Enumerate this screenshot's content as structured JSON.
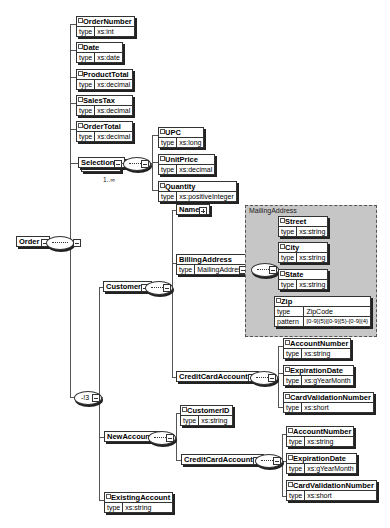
{
  "root": {
    "name": "Order"
  },
  "order_children": [
    {
      "name": "OrderNumber",
      "type_label": "type",
      "type": "xs:int"
    },
    {
      "name": "Date",
      "type_label": "type",
      "type": "xs:date"
    },
    {
      "name": "ProductTotal",
      "type_label": "type",
      "type": "xs:decimal"
    },
    {
      "name": "SalesTax",
      "type_label": "type",
      "type": "xs:decimal"
    },
    {
      "name": "OrderTotal",
      "type_label": "type",
      "type": "xs:decimal"
    }
  ],
  "selection": {
    "name": "Selection",
    "occurrence": "1..∞",
    "children": [
      {
        "name": "UPC",
        "type_label": "type",
        "type": "xs:long"
      },
      {
        "name": "UnitPrice",
        "type_label": "type",
        "type": "xs:decimal"
      },
      {
        "name": "Quantity",
        "type_label": "type",
        "type": "xs:positiveInteger"
      }
    ]
  },
  "choice": {
    "symbol": "-!3"
  },
  "customer": {
    "name": "Customer",
    "name_el": {
      "name": "Name"
    },
    "billing": {
      "name": "BillingAddress",
      "type_label": "type",
      "type": "MailingAddress"
    },
    "mailing_group": {
      "label": "MailingAddress",
      "children": [
        {
          "name": "Street",
          "type_label": "type",
          "type": "xs:string"
        },
        {
          "name": "City",
          "type_label": "type",
          "type": "xs:string"
        },
        {
          "name": "State",
          "type_label": "type",
          "type": "xs:string"
        }
      ],
      "zip": {
        "name": "Zip",
        "type_label": "type",
        "type": "ZipCode",
        "pattern_label": "pattern",
        "pattern": "[0-9]{5}|[0-9]{5}-[0-9]{4}"
      }
    },
    "credit_card": {
      "name": "CreditCardAccount",
      "children": [
        {
          "name": "AccountNumber",
          "type_label": "type",
          "type": "xs:string"
        },
        {
          "name": "ExpirationDate",
          "type_label": "type",
          "type": "xs:gYearMonth"
        },
        {
          "name": "CardValidationNumber",
          "type_label": "type",
          "type": "xs:short"
        }
      ]
    }
  },
  "new_account": {
    "name": "NewAccount",
    "customer_id": {
      "name": "CustomerID",
      "type_label": "type",
      "type": "xs:string"
    },
    "credit_card": {
      "name": "CreditCardAccount",
      "children": [
        {
          "name": "AccountNumber",
          "type_label": "type",
          "type": "xs:string"
        },
        {
          "name": "ExpirationDate",
          "type_label": "type",
          "type": "xs:gYearMonth"
        },
        {
          "name": "CardValidationNumber",
          "type_label": "type",
          "type": "xs:short"
        }
      ]
    }
  },
  "existing_account": {
    "name": "ExistingAccount",
    "type_label": "type",
    "type": "xs:string"
  }
}
